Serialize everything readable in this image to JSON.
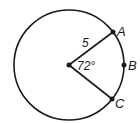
{
  "diagram": {
    "type": "circle-sector",
    "circle": {
      "cx": 69,
      "cy": 65,
      "r": 55,
      "stroke": "#1a1a1a"
    },
    "center": {
      "x": 69,
      "y": 65
    },
    "points": [
      {
        "name": "A",
        "x": 113,
        "y": 32,
        "label_x": 117,
        "label_y": 36
      },
      {
        "name": "B",
        "x": 124,
        "y": 65,
        "label_x": 128,
        "label_y": 70
      },
      {
        "name": "C",
        "x": 112,
        "y": 99,
        "label_x": 115,
        "label_y": 108
      }
    ],
    "radius_label": {
      "text": "5",
      "x": 82,
      "y": 47
    },
    "angle_label": {
      "text": "72°",
      "x": 77,
      "y": 70
    }
  }
}
